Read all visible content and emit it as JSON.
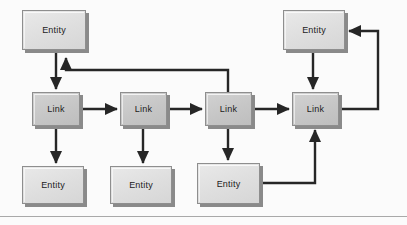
{
  "diagram": {
    "background_color": "#fbfbfb",
    "rule_color": "#a9a9a9",
    "edge_color": "#262626",
    "entity_fill": "#dedede",
    "link_fill": "#c6c6c6",
    "border_color": "#8e8e8e",
    "shadow_color": "#8a8a8a",
    "nodes": [
      {
        "id": "entity-top-left",
        "label": "Entity",
        "kind": "entity",
        "x": 22,
        "y": 10,
        "w": 64,
        "h": 40
      },
      {
        "id": "entity-top-right",
        "label": "Entity",
        "kind": "entity",
        "x": 283,
        "y": 10,
        "w": 62,
        "h": 40
      },
      {
        "id": "link-1",
        "label": "Link",
        "kind": "link",
        "x": 32,
        "y": 92,
        "w": 48,
        "h": 34
      },
      {
        "id": "link-2",
        "label": "Link",
        "kind": "link",
        "x": 120,
        "y": 92,
        "w": 47,
        "h": 34
      },
      {
        "id": "link-3",
        "label": "Link",
        "kind": "link",
        "x": 205,
        "y": 92,
        "w": 47,
        "h": 34
      },
      {
        "id": "link-4",
        "label": "Link",
        "kind": "link",
        "x": 292,
        "y": 92,
        "w": 47,
        "h": 34
      },
      {
        "id": "entity-bottom-left",
        "label": "Entity",
        "kind": "entity",
        "x": 22,
        "y": 166,
        "w": 62,
        "h": 38
      },
      {
        "id": "entity-bottom-mid",
        "label": "Entity",
        "kind": "entity",
        "x": 110,
        "y": 166,
        "w": 62,
        "h": 38
      },
      {
        "id": "entity-bottom-right",
        "label": "Entity",
        "kind": "entity",
        "x": 197,
        "y": 163,
        "w": 63,
        "h": 41
      }
    ],
    "edges": [
      {
        "id": "edge-entity-top-left-to-link-1",
        "from": "entity-top-left",
        "to": "link-1",
        "path": "M 56 50 L 56 89",
        "arrow": "end"
      },
      {
        "id": "edge-link-1-to-link-2",
        "from": "link-1",
        "to": "link-2",
        "path": "M 80 109 L 117 109",
        "arrow": "end"
      },
      {
        "id": "edge-link-2-to-link-3",
        "from": "link-2",
        "to": "link-3",
        "path": "M 167 109 L 202 109",
        "arrow": "end"
      },
      {
        "id": "edge-link-3-to-link-4",
        "from": "link-3",
        "to": "link-4",
        "path": "M 252 109 L 289 109",
        "arrow": "end"
      },
      {
        "id": "edge-link-1-to-entity-bottom-left",
        "from": "link-1",
        "to": "entity-bottom-left",
        "path": "M 56 126 L 56 163",
        "arrow": "end"
      },
      {
        "id": "edge-link-2-to-entity-bottom-mid",
        "from": "link-2",
        "to": "entity-bottom-mid",
        "path": "M 143 126 L 143 163",
        "arrow": "end"
      },
      {
        "id": "edge-link-3-to-entity-bottom-right",
        "from": "link-3",
        "to": "entity-bottom-right",
        "path": "M 228 126 L 228 160",
        "arrow": "end"
      },
      {
        "id": "edge-link-3-feedback-to-entity-top-left",
        "from": "link-3",
        "to": "entity-top-left",
        "path": "M 228 92 L 228 70 L 66 70 L 66 58",
        "arrow": "end"
      },
      {
        "id": "edge-entity-top-right-to-link-4",
        "from": "entity-top-right",
        "to": "link-4",
        "path": "M 313 50 L 313 89",
        "arrow": "end"
      },
      {
        "id": "edge-link-4-feedback-to-entity-top-right",
        "from": "link-4",
        "to": "entity-top-right",
        "path": "M 339 109 L 378 109 L 378 31 L 349 31",
        "arrow": "end"
      },
      {
        "id": "edge-entity-bottom-right-to-link-4",
        "from": "entity-bottom-right",
        "to": "link-4",
        "path": "M 260 183 L 315 183 L 315 130",
        "arrow": "end"
      }
    ],
    "rules": [
      {
        "id": "bottom-rule",
        "y": 216
      }
    ]
  }
}
